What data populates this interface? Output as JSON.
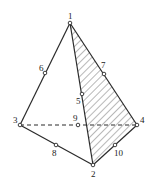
{
  "diagram": {
    "type": "tetrahedral-element",
    "colors": {
      "line": "#2a2a2a",
      "background": "#ffffff"
    },
    "vertices": [
      {
        "id": "1",
        "x": 70,
        "y": 23,
        "label": "1",
        "lx": 68,
        "ly": 19
      },
      {
        "id": "2",
        "x": 93,
        "y": 165,
        "label": "2",
        "lx": 91,
        "ly": 177
      },
      {
        "id": "3",
        "x": 20,
        "y": 125,
        "label": "3",
        "lx": 13,
        "ly": 123
      },
      {
        "id": "4",
        "x": 137,
        "y": 125,
        "label": "4",
        "lx": 140,
        "ly": 123
      }
    ],
    "mid_nodes": [
      {
        "id": "5",
        "x": 82,
        "y": 94,
        "label": "5",
        "lx": 76,
        "ly": 104
      },
      {
        "id": "6",
        "x": 45,
        "y": 73,
        "label": "6",
        "lx": 39,
        "ly": 71
      },
      {
        "id": "7",
        "x": 104,
        "y": 74,
        "label": "7",
        "lx": 101,
        "ly": 68
      },
      {
        "id": "8",
        "x": 56,
        "y": 145,
        "label": "8",
        "lx": 52,
        "ly": 156
      },
      {
        "id": "9",
        "x": 78,
        "y": 125,
        "label": "9",
        "lx": 73,
        "ly": 121
      },
      {
        "id": "10",
        "x": 115,
        "y": 145,
        "label": "10",
        "lx": 114,
        "ly": 156
      }
    ],
    "edges_solid": [
      [
        "1",
        "3"
      ],
      [
        "1",
        "2"
      ],
      [
        "1",
        "4"
      ],
      [
        "3",
        "2"
      ],
      [
        "2",
        "4"
      ]
    ],
    "edges_hidden": [
      [
        "3",
        "4"
      ]
    ],
    "shaded_face": [
      "1",
      "2",
      "4"
    ]
  }
}
